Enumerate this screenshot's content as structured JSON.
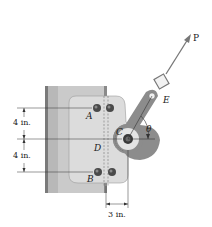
{
  "figure": {
    "type": "engineering statics diagram"
  },
  "labels": {
    "force": "P",
    "point_e": "E",
    "point_a": "A",
    "point_b": "B",
    "point_c": "C",
    "point_d": "D",
    "angle": "θ"
  },
  "dimensions": {
    "upper_vertical": "4 in.",
    "lower_vertical": "4 in.",
    "horizontal": "3 in."
  },
  "colors": {
    "column": "#c8c8c8",
    "column_edge": "#7a7a7a",
    "plate": "#d9d9d9",
    "lever": "#8a8a8a",
    "bolt": "#4a4a4a",
    "hub": "#e6e6e6",
    "line": "#333333",
    "arrow": "#777777"
  }
}
